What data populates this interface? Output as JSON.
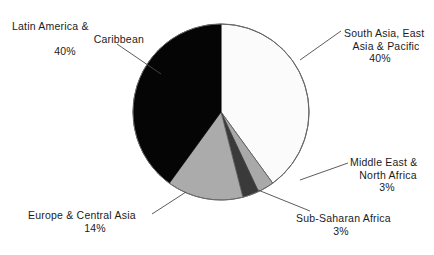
{
  "chart_data": {
    "type": "pie",
    "title": "",
    "subtitle": "",
    "xlabel": "",
    "ylabel": "",
    "legend_position": "none",
    "grid": false,
    "labels_show_percent": true,
    "start_angle_deg": 0,
    "direction": "clockwise",
    "categories": [
      "South Asia, East Asia & Pacific",
      "Middle East & North Africa",
      "Sub-Saharan Africa",
      "Europe & Central Asia",
      "Latin America & Caribbean"
    ],
    "values": [
      40,
      3,
      3,
      14,
      40
    ],
    "unit": "%",
    "slices": [
      {
        "name": "South Asia, East Asia & Pacific",
        "value": 40,
        "percent_text": "40%",
        "color": "#fbfbfb",
        "label_lines": [
          "South Asia, East",
          "Asia & Pacific",
          "40%"
        ]
      },
      {
        "name": "Middle East & North Africa",
        "value": 3,
        "percent_text": "3%",
        "color": "#a9a9a9",
        "label_lines": [
          "Middle East &",
          "North Africa",
          "3%"
        ]
      },
      {
        "name": "Sub-Saharan Africa",
        "value": 3,
        "percent_text": "3%",
        "color": "#3a3a3a",
        "label_lines": [
          "Sub-Saharan Africa",
          "3%"
        ]
      },
      {
        "name": "Europe & Central Asia",
        "value": 14,
        "percent_text": "14%",
        "color": "#ababab",
        "label_lines": [
          "Europe & Central Asia",
          "14%"
        ]
      },
      {
        "name": "Latin America & Caribbean",
        "value": 40,
        "percent_text": "40%",
        "color": "#050505",
        "label_lines": [
          "Latin America &",
          "Caribbean",
          "40%"
        ]
      }
    ]
  },
  "labels": {
    "latin_america": {
      "line1": "Latin America &",
      "line2": "Caribbean",
      "line3": "40%"
    },
    "south_asia": {
      "line1": "South Asia, East",
      "line2": "Asia & Pacific",
      "line3": "40%"
    },
    "middle_east": {
      "line1": "Middle East &",
      "line2": "North Africa",
      "line3": "3%"
    },
    "sub_saharan": {
      "line1": "Sub-Saharan Africa",
      "line2": "3%"
    },
    "europe": {
      "line1": "Europe & Central Asia",
      "line2": "14%"
    }
  },
  "colors": {
    "background": "#ffffff",
    "outline": "#5a5a5a",
    "leader_line": "#4a4a4a",
    "text": "#1b1b1b"
  }
}
